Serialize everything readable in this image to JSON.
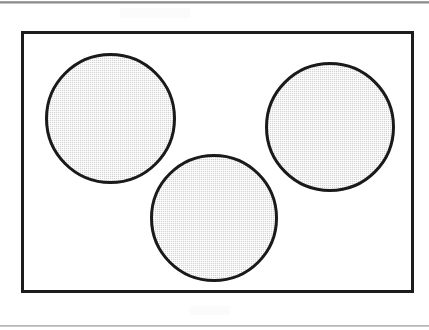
{
  "figure": {
    "canvas": {
      "width": 429,
      "height": 330,
      "background_color": "#ffffff"
    },
    "scan_artifacts": [
      {
        "name": "top-rule",
        "y": 1,
        "height": 3,
        "color": "#6e6e6e"
      },
      {
        "name": "bottom-rule",
        "y": 325,
        "height": 2,
        "color": "#8a8a8a"
      }
    ],
    "outer_rectangle": {
      "label": "",
      "x": 21,
      "y": 31,
      "width": 393,
      "height": 262,
      "stroke_color": "#1c1c1c",
      "stroke_width": 3,
      "fill_color": "#ffffff"
    },
    "shapes": [
      {
        "name": "circle-top-left",
        "label": "",
        "center_x": 107,
        "center_y": 115,
        "diameter": 131,
        "fill_color": "#d2d2d2",
        "stroke_color": "#1a1a1a",
        "stroke_width": 3,
        "fill_style": "halftone-dither"
      },
      {
        "name": "circle-top-right",
        "label": "",
        "center_x": 327,
        "center_y": 124,
        "diameter": 130,
        "fill_color": "#d2d2d2",
        "stroke_color": "#1a1a1a",
        "stroke_width": 3,
        "fill_style": "halftone-dither"
      },
      {
        "name": "circle-bottom-center",
        "label": "",
        "center_x": 211,
        "center_y": 215,
        "diameter": 128,
        "fill_color": "#d2d2d2",
        "stroke_color": "#1a1a1a",
        "stroke_width": 3,
        "fill_style": "halftone-dither"
      }
    ]
  }
}
